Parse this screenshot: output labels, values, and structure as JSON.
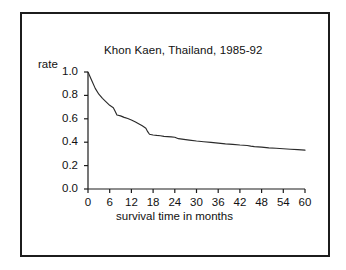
{
  "chart_data": {
    "type": "line",
    "title": "Khon Kaen, Thailand, 1985-92",
    "xlabel": "survival time in months",
    "ylabel": "rate",
    "xlim": [
      0,
      60
    ],
    "ylim": [
      0.0,
      1.0
    ],
    "xticks": [
      0,
      6,
      12,
      18,
      24,
      30,
      36,
      42,
      48,
      54,
      60
    ],
    "xtick_labels": [
      "0",
      "6",
      "12",
      "18",
      "24",
      "30",
      "36",
      "42",
      "48",
      "54",
      "60"
    ],
    "yticks": [
      0.0,
      0.2,
      0.4,
      0.6,
      0.8,
      1.0
    ],
    "ytick_labels": [
      "0.0",
      "0.2",
      "0.4",
      "0.6",
      "0.8",
      "1.0"
    ],
    "grid": false,
    "legend": false,
    "line_color": "#2b2b2b",
    "series": [
      {
        "name": "survival rate",
        "x": [
          0,
          1,
          2,
          3,
          4,
          5,
          6,
          7,
          7.5,
          8,
          9,
          10,
          11,
          12,
          13,
          14,
          15,
          16,
          16.5,
          17,
          18,
          19,
          20,
          21,
          22,
          23,
          24,
          25,
          26,
          27,
          28,
          30,
          32,
          34,
          36,
          38,
          40,
          42,
          44,
          45,
          46,
          48,
          50,
          52,
          54,
          56,
          58,
          60
        ],
        "y": [
          1.0,
          0.93,
          0.86,
          0.81,
          0.775,
          0.745,
          0.715,
          0.695,
          0.665,
          0.632,
          0.625,
          0.612,
          0.602,
          0.59,
          0.575,
          0.558,
          0.54,
          0.52,
          0.49,
          0.468,
          0.462,
          0.458,
          0.455,
          0.45,
          0.448,
          0.446,
          0.442,
          0.43,
          0.426,
          0.422,
          0.418,
          0.41,
          0.404,
          0.398,
          0.392,
          0.386,
          0.382,
          0.376,
          0.372,
          0.366,
          0.362,
          0.358,
          0.352,
          0.348,
          0.344,
          0.34,
          0.336,
          0.332
        ]
      }
    ]
  },
  "figure": {
    "border_color": "#1c1c1c",
    "background": "#ffffff"
  },
  "axes_geometry": {
    "left": 88,
    "right": 305,
    "top": 72,
    "bottom": 189
  }
}
